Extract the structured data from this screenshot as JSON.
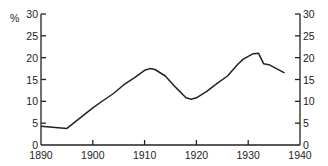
{
  "chart_data": {
    "type": "line",
    "title": "",
    "xlabel": "",
    "ylabel": "%",
    "xlim": [
      1890,
      1940
    ],
    "ylim": [
      0,
      30
    ],
    "x_ticks": [
      1890,
      1900,
      1910,
      1920,
      1930,
      1940
    ],
    "y_ticks": [
      0,
      5,
      10,
      15,
      20,
      25,
      30
    ],
    "y_axis_right_mirror": true,
    "grid": false,
    "legend": null,
    "series": [
      {
        "name": "Rate",
        "color": "#222222",
        "x": [
          1890,
          1895,
          1898,
          1900,
          1902,
          1904,
          1906,
          1908,
          1910,
          1911,
          1912,
          1914,
          1916,
          1918,
          1919,
          1920,
          1922,
          1924,
          1926,
          1928,
          1929,
          1930,
          1931,
          1932,
          1933,
          1934,
          1935,
          1937
        ],
        "values": [
          4.3,
          3.8,
          6.6,
          8.5,
          10.2,
          11.8,
          13.8,
          15.4,
          17.1,
          17.5,
          17.3,
          15.8,
          13.2,
          10.8,
          10.5,
          10.8,
          12.3,
          14.1,
          15.8,
          18.5,
          19.6,
          20.3,
          20.9,
          21.0,
          18.6,
          18.4,
          17.8,
          16.5
        ]
      }
    ]
  }
}
